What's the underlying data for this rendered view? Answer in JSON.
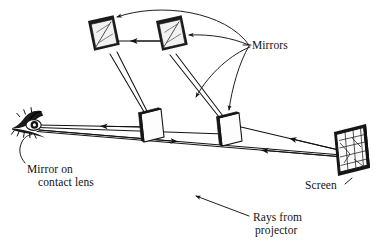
{
  "figure": {
    "background_color": "#ffffff",
    "ink_color": "#131313",
    "labels": {
      "mirrors": "Mirrors",
      "screen": "Screen",
      "mirror_on_contact_lens_line1": "Mirror on",
      "mirror_on_contact_lens_line2": "contact lens",
      "rays_from_projector_line1": "Rays from",
      "rays_from_projector_line2": "projector"
    },
    "components": [
      {
        "name": "eye-with-contact-lens-mirror",
        "kind": "eye",
        "x": 33,
        "y": 124
      },
      {
        "name": "mirror-top-left",
        "kind": "mirror",
        "x": 99,
        "y": 36
      },
      {
        "name": "mirror-top-right",
        "kind": "mirror",
        "x": 167,
        "y": 36
      },
      {
        "name": "mirror-mid-left",
        "kind": "mirror",
        "x": 150,
        "y": 126
      },
      {
        "name": "mirror-mid-right",
        "kind": "mirror",
        "x": 228,
        "y": 130
      },
      {
        "name": "projection-screen",
        "kind": "screen",
        "x": 350,
        "y": 148
      }
    ],
    "ray_segments": [
      {
        "name": "screen-to-mid-right",
        "from": "projection-screen",
        "to": "mirror-mid-right",
        "direction": "leftward"
      },
      {
        "name": "mid-right-to-eye",
        "from": "mirror-mid-right",
        "to": "eye-with-contact-lens-mirror",
        "direction": "leftward"
      },
      {
        "name": "eye-to-mid-left",
        "from": "eye-with-contact-lens-mirror",
        "to": "mirror-mid-left",
        "direction": "rightward"
      },
      {
        "name": "mid-left-to-eye",
        "from": "mirror-mid-left",
        "to": "eye-with-contact-lens-mirror",
        "direction": "leftward"
      },
      {
        "name": "mid-left-to-top-left",
        "from": "mirror-mid-left",
        "to": "mirror-top-left",
        "direction": "upward"
      },
      {
        "name": "top-right-to-top-left",
        "from": "mirror-top-right",
        "to": "mirror-top-left",
        "direction": "leftward"
      },
      {
        "name": "top-right-to-mid-right",
        "from": "mirror-top-right",
        "to": "mirror-mid-right",
        "direction": "downward"
      },
      {
        "name": "projector-ray-to-eye",
        "from": "projector",
        "to": "eye-with-contact-lens-mirror",
        "direction": "leftward"
      }
    ],
    "leader_lines": [
      {
        "name": "leader-mirrors-to-top-left",
        "target": "mirror-top-left"
      },
      {
        "name": "leader-mirrors-to-top-right",
        "target": "mirror-top-right"
      },
      {
        "name": "leader-mirrors-to-mid-left",
        "target": "mirror-mid-left"
      },
      {
        "name": "leader-mirrors-to-mid-right",
        "target": "mirror-mid-right"
      },
      {
        "name": "leader-contact-lens",
        "target": "eye-with-contact-lens-mirror"
      },
      {
        "name": "leader-screen",
        "target": "projection-screen"
      },
      {
        "name": "leader-rays-from-projector",
        "target": "projector-ray-to-eye"
      }
    ]
  }
}
